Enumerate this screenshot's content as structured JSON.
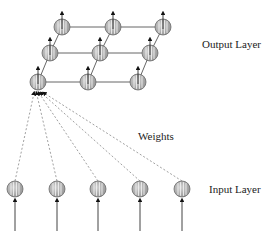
{
  "diagram": {
    "type": "self-organizing-map",
    "labels": {
      "output_layer": "Output Layer",
      "weights": "Weights",
      "input_layer": "Input Layer"
    },
    "output_grid": {
      "rows": 3,
      "cols": 3,
      "nodes": [
        [
          {
            "x": 62,
            "y": 27
          },
          {
            "x": 113,
            "y": 27
          },
          {
            "x": 163,
            "y": 27
          }
        ],
        [
          {
            "x": 50,
            "y": 53
          },
          {
            "x": 100,
            "y": 53
          },
          {
            "x": 150,
            "y": 53
          }
        ],
        [
          {
            "x": 38,
            "y": 82
          },
          {
            "x": 88,
            "y": 82
          },
          {
            "x": 138,
            "y": 82
          }
        ]
      ]
    },
    "input_nodes": [
      {
        "x": 15,
        "y": 189
      },
      {
        "x": 57,
        "y": 189
      },
      {
        "x": 98,
        "y": 189
      },
      {
        "x": 140,
        "y": 189
      },
      {
        "x": 182,
        "y": 189
      }
    ],
    "colors": {
      "node_fill": "#b0b0b0",
      "node_stroke": "#6a6a6a",
      "line": "#666666",
      "dashed": "#888888",
      "arrow": "#111111"
    }
  }
}
